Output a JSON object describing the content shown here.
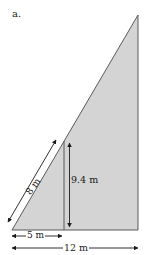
{
  "figure": {
    "part_label": "a.",
    "shape": "right triangle",
    "fill_color": "#d4d4d4",
    "stroke_color": "#4a4a4a",
    "dimensions": {
      "slant_segment": "8 m",
      "inner_height": "9.4 m",
      "inner_base": "5 m",
      "total_base": "12 m"
    }
  }
}
